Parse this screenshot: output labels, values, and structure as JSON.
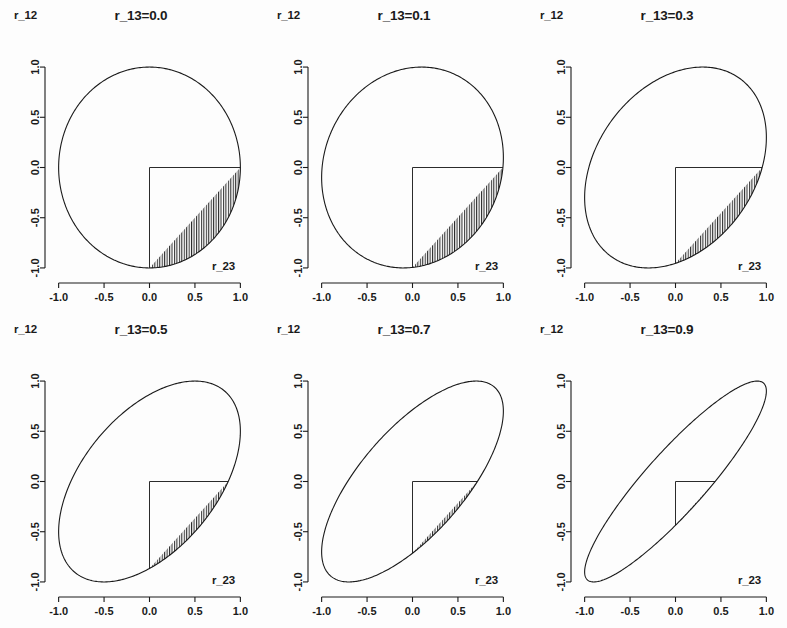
{
  "figure": {
    "type": "multi-panel-scatter-region",
    "rows": 2,
    "cols": 3,
    "background_color": "#fdfdfd",
    "line_color": "#1a1a1a",
    "hatch_color": "#2b2b2b"
  },
  "axes": {
    "x_label": "r_23",
    "y_label": "r_12",
    "x_ticks": [
      "-1.0",
      "-0.5",
      "0.0",
      "0.5",
      "1.0"
    ],
    "y_ticks": [
      "1.0",
      "0.5",
      "0.0",
      "-0.5",
      "-1.0"
    ],
    "x_tick_values": [
      -1.0,
      -0.5,
      0.0,
      0.5,
      1.0
    ],
    "y_tick_values": [
      1.0,
      0.5,
      0.0,
      -0.5,
      -1.0
    ],
    "xlim": [
      -1.15,
      1.15
    ],
    "ylim": [
      -1.15,
      1.15
    ]
  },
  "panels": [
    {
      "title": "r_13=0.0",
      "r13": 0.0,
      "x_label": "r_23",
      "y_label": "r_12"
    },
    {
      "title": "r_13=0.1",
      "r13": 0.1,
      "x_label": "r_23",
      "y_label": "r_12"
    },
    {
      "title": "r_13=0.3",
      "r13": 0.3,
      "x_label": "r_23",
      "y_label": "r_12"
    },
    {
      "title": "r_13=0.5",
      "r13": 0.5,
      "x_label": "r_23",
      "y_label": "r_12"
    },
    {
      "title": "r_13=0.7",
      "r13": 0.7,
      "x_label": "r_23",
      "y_label": "r_12"
    },
    {
      "title": "r_13=0.9",
      "r13": 0.9,
      "x_label": "r_23",
      "y_label": "r_12"
    }
  ],
  "chart_data": {
    "type": "line",
    "title": "",
    "xlabel": "r_23",
    "ylabel": "r_12",
    "xlim": [
      -1.15,
      1.15
    ],
    "ylim": [
      -1.15,
      1.15
    ],
    "grid": false,
    "legend": "none",
    "panels": [
      {
        "title": "r_13=0.0",
        "r13": 0.0,
        "ellipse": {
          "center": [
            0,
            0
          ],
          "equation": "r_12^2 + r_23^2 - 2*0.0*r_12*r_23 = 1 - 0.0^2",
          "semi_major": 1.0,
          "semi_minor": 1.0,
          "rotation_deg": 45
        },
        "hatched_region": {
          "x_range": [
            0.0,
            1.0
          ],
          "y_range": [
            -1.0,
            0.0
          ],
          "style": "vertical-lines"
        }
      },
      {
        "title": "r_13=0.1",
        "r13": 0.1,
        "ellipse": {
          "center": [
            0,
            0
          ],
          "equation": "r_12^2 + r_23^2 - 2*0.1*r_12*r_23 = 1 - 0.1^2",
          "semi_major": 1.044,
          "semi_minor": 0.949,
          "rotation_deg": 45
        },
        "hatched_region": {
          "x_range": [
            0.0,
            1.0
          ],
          "y_range": [
            -0.995,
            0.0
          ],
          "style": "vertical-lines"
        }
      },
      {
        "title": "r_13=0.3",
        "r13": 0.3,
        "ellipse": {
          "center": [
            0,
            0
          ],
          "equation": "r_12^2 + r_23^2 - 2*0.3*r_12*r_23 = 1 - 0.3^2",
          "semi_major": 1.141,
          "semi_minor": 0.841,
          "rotation_deg": 45
        },
        "hatched_region": {
          "x_range": [
            0.0,
            0.954
          ],
          "y_range": [
            -0.954,
            0.0
          ],
          "style": "vertical-lines"
        }
      },
      {
        "title": "r_13=0.5",
        "r13": 0.5,
        "ellipse": {
          "center": [
            0,
            0
          ],
          "equation": "r_12^2 + r_23^2 - 2*0.5*r_12*r_23 = 1 - 0.5^2",
          "semi_major": 1.225,
          "semi_minor": 0.707,
          "rotation_deg": 45
        },
        "hatched_region": {
          "x_range": [
            0.0,
            0.866
          ],
          "y_range": [
            -0.866,
            0.0
          ],
          "style": "vertical-lines"
        }
      },
      {
        "title": "r_13=0.7",
        "r13": 0.7,
        "ellipse": {
          "center": [
            0,
            0
          ],
          "equation": "r_12^2 + r_23^2 - 2*0.7*r_12*r_23 = 1 - 0.7^2",
          "semi_major": 1.304,
          "semi_minor": 0.548,
          "rotation_deg": 45
        },
        "hatched_region": {
          "x_range": [
            0.0,
            0.714
          ],
          "y_range": [
            -0.714,
            0.0
          ],
          "style": "vertical-lines"
        }
      },
      {
        "title": "r_13=0.9",
        "r13": 0.9,
        "ellipse": {
          "center": [
            0,
            0
          ],
          "equation": "r_12^2 + r_23^2 - 2*0.9*r_12*r_23 = 1 - 0.9^2",
          "semi_major": 1.378,
          "semi_minor": 0.316,
          "rotation_deg": 45
        },
        "hatched_region": {
          "x_range": [
            0.0,
            0.436
          ],
          "y_range": [
            -0.436,
            0.0
          ],
          "style": "vertical-lines"
        }
      }
    ]
  }
}
